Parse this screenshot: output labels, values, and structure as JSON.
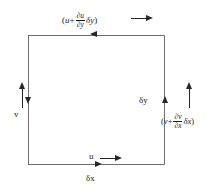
{
  "figure": {
    "type": "fluid-mechanics-control-volume-diagram",
    "background_color": "#ffffff",
    "line_color": "#6f6f6f",
    "text_color": "#1c1c1c"
  },
  "box": {
    "name": "fluid-element-square",
    "left": 28,
    "top": 35,
    "width": 137,
    "height": 130
  },
  "labels": {
    "top_expression": {
      "open_paren": "(",
      "base_symbol": "u",
      "plus": "+",
      "numerator": "∂u",
      "denominator": "∂y",
      "differential": "δy",
      "close_paren": ")",
      "arrow": "→",
      "full_text": "(u + ∂u/∂y δy) →"
    },
    "right_expression": {
      "open_paren": "(",
      "base_symbol": "v",
      "plus": "+",
      "numerator": "∂v",
      "denominator": "∂x",
      "differential": "δx",
      "close_paren": ")",
      "full_text": "(v + ∂v/∂x δx)"
    },
    "delta_y": "δy",
    "delta_x": "δx",
    "bottom_u": "u",
    "bottom_u_arrow": "→",
    "left_v": "v"
  },
  "arrows": {
    "top_edge": {
      "name": "top-edge-arrowhead",
      "direction": "left"
    },
    "bottom_edge": {
      "name": "bottom-edge-arrowhead",
      "direction": "right"
    },
    "left_edge": {
      "name": "left-edge-arrowhead",
      "direction": "down"
    },
    "right_edge": {
      "name": "right-edge-arrowhead",
      "direction": "up"
    },
    "left_vector": {
      "name": "left-velocity-arrow",
      "direction": "up"
    },
    "right_vector": {
      "name": "right-velocity-arrow",
      "direction": "up"
    },
    "top_vector": {
      "name": "top-velocity-arrow",
      "direction": "right"
    },
    "bottom_vector": {
      "name": "bottom-velocity-arrow",
      "direction": "right"
    }
  }
}
